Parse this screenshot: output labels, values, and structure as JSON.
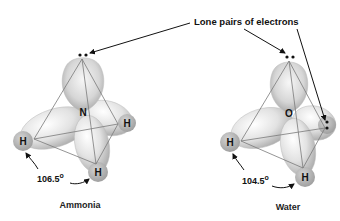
{
  "annotation": {
    "label": "Lone pairs of electrons"
  },
  "molecules": [
    {
      "name": "Ammonia",
      "central_atom": "N",
      "bonded_atoms": [
        "H",
        "H",
        "H"
      ],
      "bond_angle": "106.5",
      "angle_unit": "o",
      "lone_pairs": 1
    },
    {
      "name": "Water",
      "central_atom": "O",
      "bonded_atoms": [
        "H",
        "H"
      ],
      "bond_angle": "104.5",
      "angle_unit": "o",
      "lone_pairs": 2
    }
  ],
  "colors": {
    "lobe_light": "#f2f2f2",
    "lobe_dark": "#a8a8a8",
    "hydrogen": "#b5b5b5",
    "edge": "#777777",
    "text": "#111111"
  }
}
